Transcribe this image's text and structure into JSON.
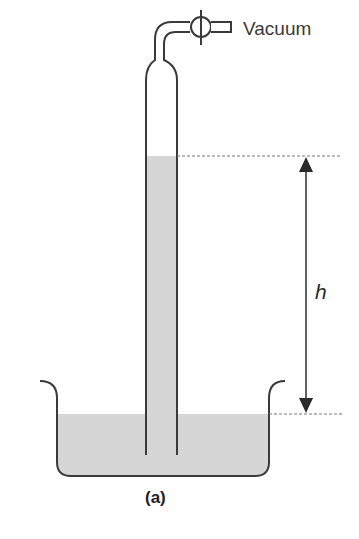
{
  "diagram": {
    "labels": {
      "vacuum": "Vacuum",
      "height": "h",
      "caption": "(a)"
    },
    "colors": {
      "stroke": "#3a3a3a",
      "liquid": "#d6d6d6",
      "dashed": "#7a7a7a",
      "background": "#ffffff"
    },
    "components": [
      {
        "name": "vertical-tube",
        "description": "Closed-top glass tube inverted in liquid, connected to vacuum line"
      },
      {
        "name": "stopcock-valve",
        "description": "Valve on the line to vacuum"
      },
      {
        "name": "beaker",
        "description": "Open dish containing liquid"
      },
      {
        "name": "height-arrow",
        "description": "Double-headed arrow marking column height h"
      }
    ]
  }
}
